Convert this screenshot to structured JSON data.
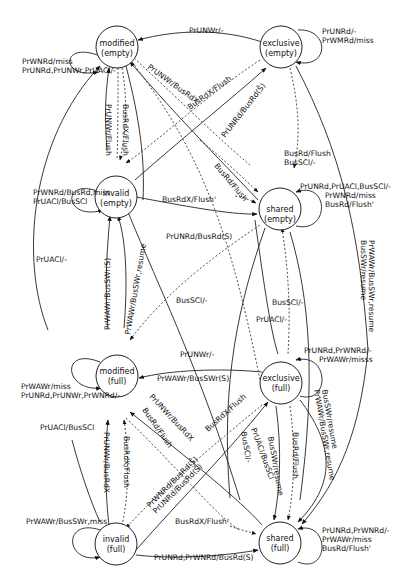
{
  "diagram": {
    "title": "",
    "states": [
      {
        "id": "modified_empty",
        "line1": "modified",
        "line2": "(empty)"
      },
      {
        "id": "exclusive_empty",
        "line1": "exclusive",
        "line2": "(empty)"
      },
      {
        "id": "invalid_empty",
        "line1": "invalid",
        "line2": "(empty)"
      },
      {
        "id": "shared_empty",
        "line1": "shared",
        "line2": "(empty)"
      },
      {
        "id": "modified_full",
        "line1": "modified",
        "line2": "(full)"
      },
      {
        "id": "exclusive_full",
        "line1": "exclusive",
        "line2": "(full)"
      },
      {
        "id": "invalid_full",
        "line1": "invalid",
        "line2": "(full)"
      },
      {
        "id": "shared_full",
        "line1": "shared",
        "line2": "(full)"
      }
    ],
    "self_loops": {
      "modified_empty": [
        "PrWNRd/miss",
        "PrUNRd,PrUNWr,PrUACl/-"
      ],
      "exclusive_empty": [
        "PrUNRd/-",
        "PrWMRd/miss"
      ],
      "invalid_empty": [
        "PrWNRd/BusRd,miss",
        "PrUACl/BusSCl"
      ],
      "shared_empty": [
        "PrUNRd,PrUACl,BusSCl/-",
        "PrWNRd/miss",
        "BusRd/Flush'"
      ],
      "modified_full": [
        "PrWAWr/miss",
        "PrUNRd,PrUNWr,PrWNRd/-"
      ],
      "exclusive_full": [
        "PrUNRd,PrWNRd/-",
        "PrWAWr/misss"
      ],
      "invalid_full": [
        "PrWAWr/BusSWr,miss"
      ],
      "shared_full": [
        "PrUNRd,PrWNRd/-",
        "PrWAWr/miss",
        "BusRd/Flush'"
      ]
    },
    "edge_labels": {
      "me_ee": "PrUNWr/-",
      "me_ie_left": "PrUNWr/Flush",
      "me_ie_right": "BusRdX/Flush",
      "me_diag_busrdx": "PrUNWr/BusRdX",
      "ee_busrdx": "BusRdX/Flush",
      "ie_ee": "PrUNRd/BusRd(S̄)",
      "se_busrd_flush_diag": "BusRd/Flush",
      "ee_se_1": "BusRd/Flush",
      "ee_se_2": "BusSCl/-",
      "ie_se_busrdx": "BusRdX/Flush'",
      "ie_se": "PrUNRd/BusRd(S)",
      "ee_right_1": "BusSWr/resume",
      "ee_right_2": "PrWAWr/BusSWr,resume",
      "ie_mf_pacl": "PrUACl/-",
      "mf_ie_1": "PrWAWr/BusSWr(S)",
      "mf_ie_2": "PrWAWr/BusSWr,resume",
      "busscl_mid": "BusSCl/-",
      "busscl_right": "BusSCl/-",
      "puacl_mid": "PrUACl/-",
      "mf_ef": "PrUNWr/-",
      "mf_sf": "PrWAWr/BusSWr(S)",
      "mf_if_1": "PrUNWr/BusRdX",
      "mf_if_2": "BusRdX/Flush",
      "mf_if_3": "PrUACl/BusSCl",
      "mf_busrdx_diag": "PrUNWr/BusRdX",
      "mf_busrd_diag": "BusRd/Flush",
      "ef_busrdx": "BusRdX/Flush",
      "if_ef_1": "PrWNRd/BusRd(S̄)",
      "if_ef_2": "PrUNRd/BusRd(S̄)",
      "ef_sf_1": "PrUACl/BusSCl",
      "ef_sf_2": "BusSCl/-",
      "ef_sf_3": "BusSWr/resume",
      "ef_sf_4": "BusRd/Flush",
      "ef_right_1": "BusSWr/resume",
      "ef_right_2": "PrWAWr/BusSWr,resume",
      "if_sf_busrdx": "BusRdX/Flush'",
      "if_sf": "PrUNRd,PrWNRd/BusRd(S)"
    }
  }
}
